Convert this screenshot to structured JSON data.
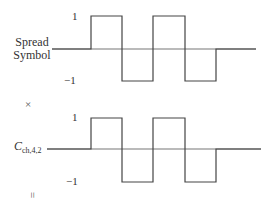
{
  "diagram": {
    "top": {
      "label_line1": "Spread",
      "label_line2": "Symbol",
      "tick_high": "1",
      "tick_low": "−1",
      "waveform": [
        0,
        1,
        -1,
        1,
        -1,
        0
      ]
    },
    "operator_multiply": "×",
    "bottom": {
      "label_main": "C",
      "label_sub": "ch,4,2",
      "tick_high": "1",
      "tick_low": "−1",
      "waveform": [
        0,
        1,
        -1,
        1,
        -1,
        0
      ]
    },
    "operator_equals": "="
  }
}
